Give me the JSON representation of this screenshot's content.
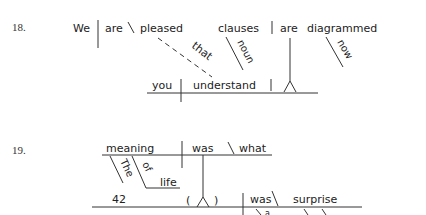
{
  "exercises": [
    {
      "number": "18.",
      "words": {
        "subject": "We",
        "verb": "are",
        "complement": "pleased",
        "connector": "that",
        "noun_clause_subject": "clauses",
        "noun_clause_verb": "are",
        "participle": "diagrammed",
        "modifier_noun": "noun",
        "modifier_now": "now",
        "sub_subject": "you",
        "sub_verb": "understand"
      }
    },
    {
      "number": "19.",
      "words": {
        "subject": "meaning",
        "verb": "was",
        "complement": "what",
        "article": "The",
        "preposition": "of",
        "object_of_prep": "life",
        "appositive": "42",
        "paren_open": "(",
        "paren_close": ")",
        "clause_verb": "was",
        "clause_complement": "surprise",
        "article_a": "a"
      }
    }
  ],
  "colors": {
    "ink": "#222222",
    "lines": "#333333",
    "background": "#ffffff"
  }
}
